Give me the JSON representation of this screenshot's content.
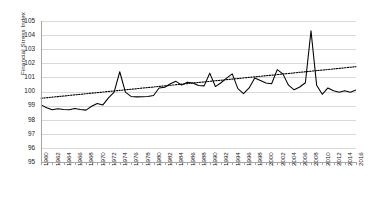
{
  "chart_data": {
    "type": "line",
    "title": "",
    "xlabel": "",
    "ylabel": "Financial Stress Index",
    "ylim": [
      95,
      105
    ],
    "ytick_labels": [
      "95",
      "96",
      "97",
      "98",
      "99",
      "100",
      "101",
      "102",
      "103",
      "104",
      "105"
    ],
    "xlim": [
      1960,
      2016
    ],
    "grid": true,
    "legend": "none",
    "xtick_labels": [
      "1960",
      "1962",
      "1964",
      "1966",
      "1968",
      "1970",
      "1972",
      "1974",
      "1976",
      "1978",
      "1980",
      "1982",
      "1984",
      "1986",
      "1988",
      "1990",
      "1992",
      "1994",
      "1996",
      "1998",
      "2000",
      "2002",
      "2004",
      "2006",
      "2008",
      "2010",
      "2012",
      "2014",
      "2016"
    ],
    "x": [
      1960,
      1961,
      1962,
      1963,
      1964,
      1965,
      1966,
      1967,
      1968,
      1969,
      1970,
      1971,
      1972,
      1973,
      1974,
      1975,
      1976,
      1977,
      1978,
      1979,
      1980,
      1981,
      1982,
      1983,
      1984,
      1985,
      1986,
      1987,
      1988,
      1989,
      1990,
      1991,
      1992,
      1993,
      1994,
      1995,
      1996,
      1997,
      1998,
      1999,
      2000,
      2001,
      2002,
      2003,
      2004,
      2005,
      2006,
      2007,
      2008,
      2009,
      2010,
      2011,
      2012,
      2013,
      2014,
      2015,
      2016
    ],
    "series": [
      {
        "name": "Financial Stress Index",
        "style": "solid",
        "color": "#000000",
        "values": [
          99.05,
          98.85,
          98.7,
          98.78,
          98.72,
          98.7,
          98.8,
          98.72,
          98.68,
          98.95,
          99.15,
          99.05,
          99.55,
          99.95,
          101.4,
          99.95,
          99.65,
          99.62,
          99.63,
          99.65,
          99.72,
          100.25,
          100.3,
          100.55,
          100.72,
          100.45,
          100.65,
          100.6,
          100.42,
          100.4,
          101.3,
          100.35,
          100.62,
          100.95,
          101.25,
          100.2,
          99.85,
          100.25,
          100.95,
          100.78,
          100.6,
          100.55,
          101.55,
          101.25,
          100.45,
          100.12,
          100.32,
          100.62,
          104.3,
          100.45,
          99.8,
          100.25,
          100.05,
          99.95,
          100.05,
          99.95,
          100.1
        ]
      },
      {
        "name": "Linear trend",
        "style": "dotted",
        "color": "#000000",
        "values": [
          99.52,
          99.56,
          99.6,
          99.64,
          99.68,
          99.72,
          99.76,
          99.8,
          99.84,
          99.88,
          99.92,
          99.96,
          100.0,
          100.04,
          100.08,
          100.12,
          100.16,
          100.2,
          100.24,
          100.28,
          100.32,
          100.36,
          100.4,
          100.44,
          100.48,
          100.52,
          100.56,
          100.6,
          100.64,
          100.68,
          100.72,
          100.76,
          100.8,
          100.84,
          100.88,
          100.92,
          100.96,
          101.0,
          101.04,
          101.08,
          101.12,
          101.16,
          101.2,
          101.24,
          101.28,
          101.32,
          101.36,
          101.4,
          101.44,
          101.48,
          101.52,
          101.56,
          101.6,
          101.64,
          101.68,
          101.72,
          101.76
        ]
      }
    ]
  }
}
